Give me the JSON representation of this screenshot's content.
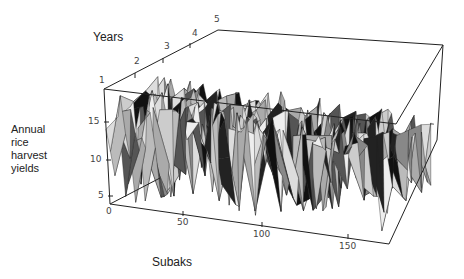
{
  "chart_data": {
    "type": "surface3d",
    "title": "",
    "zlabel_lines": [
      "Annual",
      "rice",
      "harvest",
      "yields"
    ],
    "xlabel": "Subaks",
    "ylabel": "Years",
    "x_ticks": [
      "0",
      "50",
      "100",
      "150"
    ],
    "y_ticks": [
      "1",
      "2",
      "3",
      "4",
      "5"
    ],
    "z_ticks": [
      "5",
      "10",
      "15"
    ],
    "xlim": [
      0,
      172
    ],
    "ylim": [
      1,
      5
    ],
    "zlim": [
      4,
      19
    ],
    "grid": false,
    "legend": null
  },
  "labels": {
    "years": "Years",
    "subaks": "Subaks",
    "z1": "Annual",
    "z2": "rice",
    "z3": "harvest",
    "z4": "yields"
  },
  "ticks": {
    "y1": "1",
    "y2": "2",
    "y3": "3",
    "y4": "4",
    "y5": "5",
    "x0": "0",
    "x50": "50",
    "x100": "100",
    "x150": "150",
    "z5": "5",
    "z10": "10",
    "z15": "15"
  }
}
